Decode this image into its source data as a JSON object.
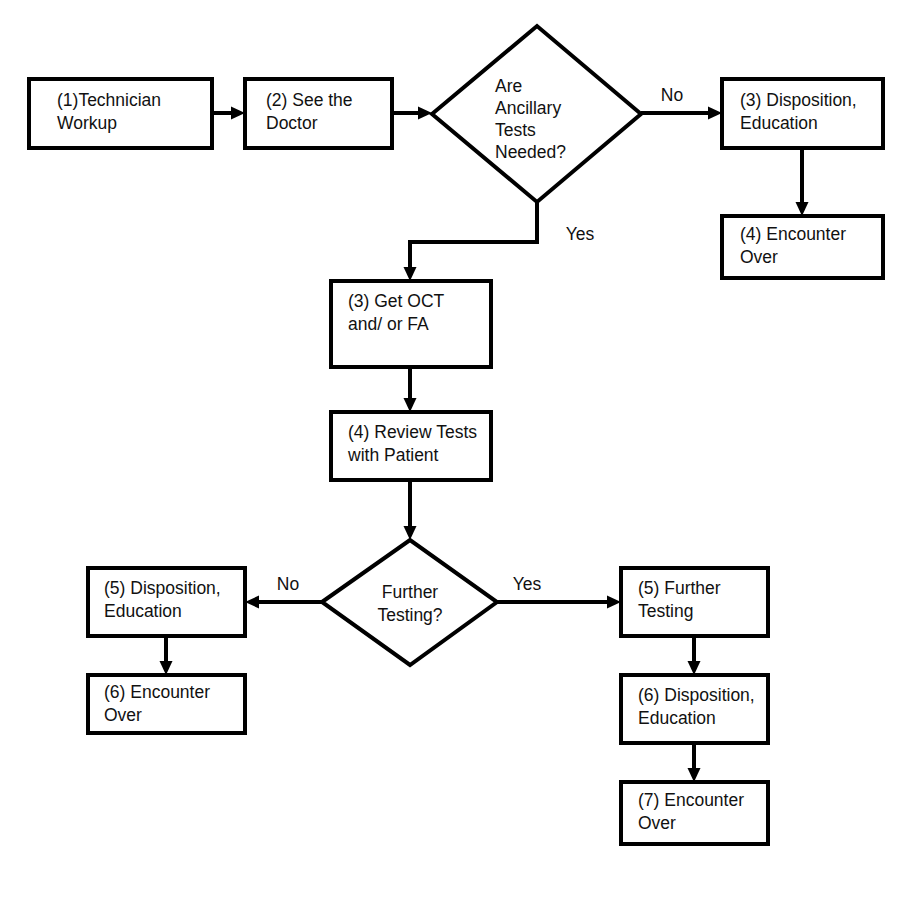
{
  "diagram": {
    "background_color": "#ffffff",
    "line_color": "#000000",
    "text_color": "#111111",
    "nodes": {
      "technician_workup": {
        "line1": "(1)Technician",
        "line2": "Workup"
      },
      "see_doctor": {
        "line1": "(2) See the",
        "line2": "Doctor"
      },
      "ancillary_decision": {
        "line1": "Are",
        "line2": "Ancillary",
        "line3": "Tests",
        "line4": "Needed?"
      },
      "disposition_top": {
        "line1": "(3) Disposition,",
        "line2": "Education"
      },
      "encounter_over_top": {
        "line1": "(4) Encounter",
        "line2": "Over"
      },
      "get_oct": {
        "line1": "(3) Get OCT",
        "line2": "and/ or FA"
      },
      "review_tests": {
        "line1": "(4) Review Tests",
        "line2": "with Patient"
      },
      "further_testing_decision": {
        "line1": "Further",
        "line2": "Testing?"
      },
      "disposition_left": {
        "line1": "(5) Disposition,",
        "line2": "Education"
      },
      "encounter_over_left": {
        "line1": "(6) Encounter",
        "line2": "Over"
      },
      "further_testing": {
        "line1": "(5) Further",
        "line2": "Testing"
      },
      "disposition_right": {
        "line1": "(6) Disposition,",
        "line2": "Education"
      },
      "encounter_over_right": {
        "line1": "(7) Encounter",
        "line2": "Over"
      }
    },
    "edge_labels": {
      "ancillary_no": "No",
      "ancillary_yes": "Yes",
      "further_no": "No",
      "further_yes": "Yes"
    }
  }
}
